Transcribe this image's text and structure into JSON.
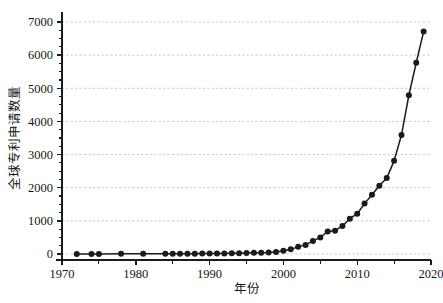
{
  "chart_data": {
    "type": "line",
    "title": "",
    "subtitle": "",
    "xlabel": "年份",
    "ylabel": "全球专利申请数量",
    "xlim": [
      1970,
      2020
    ],
    "ylim": [
      0,
      7000
    ],
    "grid": "horizontal-dashed",
    "legend": "none",
    "x_ticks": [
      1970,
      1980,
      1990,
      2000,
      2010,
      2020
    ],
    "x_tick_labels": [
      "1970",
      "1980",
      "1990",
      "2000",
      "2010",
      "2020"
    ],
    "x_minor_tick_step": 5,
    "y_ticks": [
      0,
      1000,
      2000,
      3000,
      4000,
      5000,
      6000,
      7000
    ],
    "y_tick_labels": [
      "0",
      "1000",
      "2000",
      "3000",
      "4000",
      "5000",
      "6000",
      "7000"
    ],
    "y_minor_tick_step": 250,
    "marker": "filled-circle",
    "marker_color": "#1b1b1b",
    "line_color": "#1b1b1b",
    "series": [
      {
        "name": "全球专利申请数量",
        "x": [
          1972,
          1974,
          1975,
          1978,
          1981,
          1984,
          1985,
          1986,
          1987,
          1988,
          1989,
          1990,
          1991,
          1992,
          1993,
          1994,
          1995,
          1996,
          1997,
          1998,
          1999,
          2000,
          2001,
          2002,
          2003,
          2004,
          2005,
          2006,
          2007,
          2008,
          2009,
          2010,
          2011,
          2012,
          2013,
          2014,
          2015,
          2016,
          2017,
          2018,
          2019
        ],
        "values": [
          2,
          3,
          3,
          4,
          5,
          6,
          8,
          8,
          9,
          10,
          12,
          14,
          16,
          18,
          22,
          25,
          30,
          34,
          40,
          48,
          62,
          95,
          140,
          215,
          275,
          395,
          500,
          680,
          705,
          845,
          1065,
          1215,
          1520,
          1790,
          2060,
          2290,
          2810,
          3590,
          4790,
          5770,
          6710
        ]
      }
    ]
  },
  "axis_titles": {
    "x": "年份",
    "y": "全球专利申请数量"
  }
}
